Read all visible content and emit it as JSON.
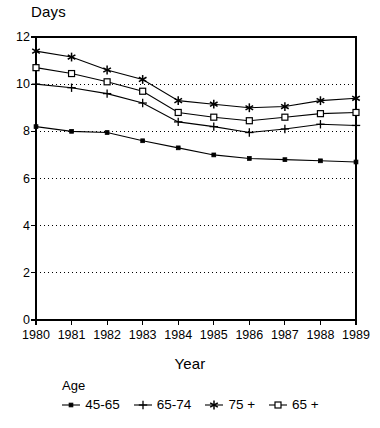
{
  "chart_data": {
    "type": "line",
    "title": "",
    "ylabel": "Days",
    "xlabel": "Year",
    "legend_title": "Age",
    "legend_position": "bottom",
    "grid": "horizontal-dotted",
    "categories": [
      "1980",
      "1981",
      "1982",
      "1983",
      "1984",
      "1985",
      "1986",
      "1987",
      "1988",
      "1989"
    ],
    "x": [
      1980,
      1981,
      1982,
      1983,
      1984,
      1985,
      1986,
      1987,
      1988,
      1989
    ],
    "xlim": [
      1980,
      1989
    ],
    "ylim": [
      0,
      12
    ],
    "yticks": [
      0,
      2,
      4,
      6,
      8,
      10,
      12
    ],
    "gridlines": [
      2,
      4,
      6,
      8,
      10
    ],
    "series": [
      {
        "name": "45-65",
        "marker": "filled-square",
        "values": [
          8.2,
          8.0,
          7.95,
          7.6,
          7.3,
          7.0,
          6.85,
          6.8,
          6.75,
          6.7
        ]
      },
      {
        "name": "65-74",
        "marker": "plus",
        "values": [
          10.0,
          9.85,
          9.6,
          9.2,
          8.4,
          8.2,
          7.95,
          8.1,
          8.3,
          8.25
        ]
      },
      {
        "name": "75 +",
        "marker": "asterisk",
        "values": [
          11.4,
          11.15,
          10.6,
          10.2,
          9.3,
          9.15,
          9.0,
          9.05,
          9.3,
          9.4
        ]
      },
      {
        "name": "65 +",
        "marker": "open-square",
        "values": [
          10.7,
          10.45,
          10.1,
          9.7,
          8.8,
          8.6,
          8.45,
          8.6,
          8.75,
          8.8
        ]
      }
    ]
  },
  "legend": {
    "title": "Age",
    "items": [
      {
        "label": "45-65",
        "marker": "filled-square"
      },
      {
        "label": "65-74",
        "marker": "plus"
      },
      {
        "label": "75 +",
        "marker": "asterisk"
      },
      {
        "label": "65 +",
        "marker": "open-square"
      }
    ]
  },
  "axes": {
    "y_title": "Days",
    "x_title": "Year"
  },
  "colors": {
    "line": "#000000",
    "grid": "#000000",
    "frame": "#000000",
    "background": "#ffffff"
  }
}
